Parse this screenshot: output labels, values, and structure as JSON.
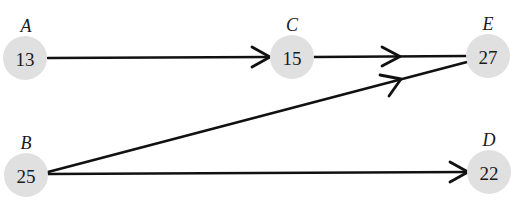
{
  "diagram": {
    "type": "directed-graph",
    "colors": {
      "node_fill": "#e0e0e0",
      "edge": "#111111",
      "text": "#1a1a1a"
    },
    "nodes": [
      {
        "id": "A",
        "label": "A",
        "value": "13"
      },
      {
        "id": "B",
        "label": "B",
        "value": "25"
      },
      {
        "id": "C",
        "label": "C",
        "value": "15"
      },
      {
        "id": "D",
        "label": "D",
        "value": "22"
      },
      {
        "id": "E",
        "label": "E",
        "value": "27"
      }
    ],
    "edges": [
      {
        "from": "A",
        "to": "C"
      },
      {
        "from": "C",
        "to": "E"
      },
      {
        "from": "B",
        "to": "E"
      },
      {
        "from": "B",
        "to": "D"
      }
    ]
  }
}
